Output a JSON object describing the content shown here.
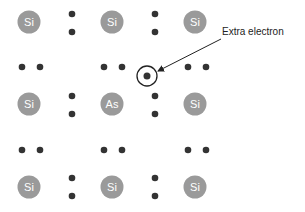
{
  "diagram": {
    "colors": {
      "atom_fill": "#9a9a9a",
      "atom_text": "#ffffff",
      "electron": "#333333",
      "line": "#222222",
      "text": "#222222"
    },
    "atoms": [
      {
        "label": "Si",
        "x": 29,
        "y": 22
      },
      {
        "label": "Si",
        "x": 112,
        "y": 22
      },
      {
        "label": "Si",
        "x": 195,
        "y": 22
      },
      {
        "label": "Si",
        "x": 29,
        "y": 104
      },
      {
        "label": "As",
        "x": 112,
        "y": 104
      },
      {
        "label": "Si",
        "x": 195,
        "y": 104
      },
      {
        "label": "Si",
        "x": 29,
        "y": 187
      },
      {
        "label": "Si",
        "x": 112,
        "y": 187
      },
      {
        "label": "Si",
        "x": 195,
        "y": 187
      }
    ],
    "electron_pairs": [
      {
        "orientation": "vertical",
        "x": 72,
        "y": 23
      },
      {
        "orientation": "vertical",
        "x": 155,
        "y": 23
      },
      {
        "orientation": "vertical",
        "x": 72,
        "y": 105
      },
      {
        "orientation": "vertical",
        "x": 155,
        "y": 105
      },
      {
        "orientation": "vertical",
        "x": 72,
        "y": 187
      },
      {
        "orientation": "vertical",
        "x": 155,
        "y": 187
      },
      {
        "orientation": "horizontal",
        "x": 31,
        "y": 67
      },
      {
        "orientation": "horizontal",
        "x": 113,
        "y": 67
      },
      {
        "orientation": "horizontal",
        "x": 197,
        "y": 67
      },
      {
        "orientation": "horizontal",
        "x": 31,
        "y": 150
      },
      {
        "orientation": "horizontal",
        "x": 113,
        "y": 150
      },
      {
        "orientation": "horizontal",
        "x": 197,
        "y": 150
      }
    ],
    "extra_electron": {
      "x": 147,
      "y": 76,
      "ring_radius": 10
    },
    "callout": {
      "label": "Extra electron",
      "text_x": 222,
      "text_y": 35,
      "arrow_from": [
        221,
        39
      ],
      "arrow_to": [
        158,
        71
      ]
    }
  }
}
